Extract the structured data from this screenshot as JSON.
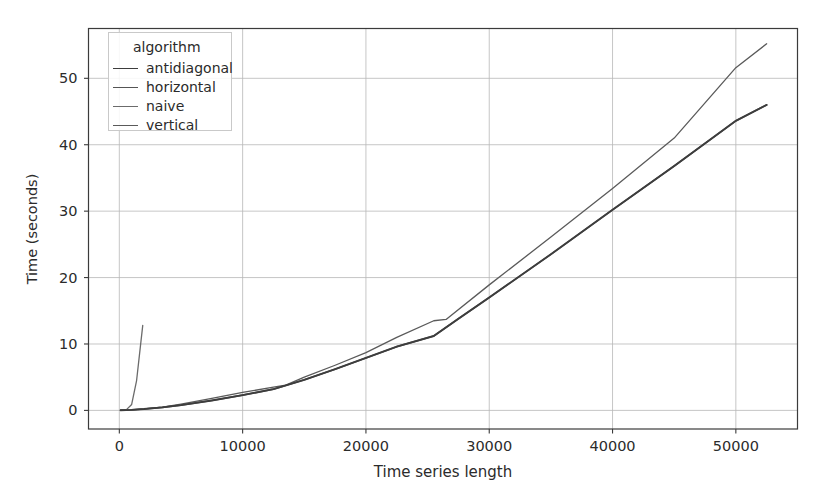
{
  "chart_data": {
    "type": "line",
    "title": "",
    "xlabel": "Time series length",
    "ylabel": "Time (seconds)",
    "xlim": [
      -2500,
      55000
    ],
    "ylim": [
      -2.8,
      57.5
    ],
    "xticks": [
      0,
      10000,
      20000,
      30000,
      40000,
      50000
    ],
    "xticklabels": [
      "0",
      "10000",
      "20000",
      "30000",
      "40000",
      "50000"
    ],
    "yticks": [
      0,
      10,
      20,
      30,
      40,
      50
    ],
    "yticklabels": [
      "0",
      "10",
      "20",
      "30",
      "40",
      "50"
    ],
    "grid": true,
    "legend": {
      "title": "algorithm",
      "position": "upper left",
      "entries": [
        "antidiagonal",
        "horizontal",
        "naive",
        "vertical"
      ]
    },
    "series": [
      {
        "name": "antidiagonal",
        "color": "#3d3d3d",
        "linewidth": 1.9,
        "x": [
          100,
          1000,
          2000,
          3500,
          5000,
          7500,
          10000,
          12500,
          15000,
          17500,
          20000,
          22500,
          25500,
          27500,
          30000,
          35000,
          40000,
          45000,
          50000,
          52500
        ],
        "y": [
          0.02,
          0.08,
          0.2,
          0.45,
          0.8,
          1.5,
          2.3,
          3.2,
          4.6,
          6.2,
          7.9,
          9.6,
          11.2,
          13.8,
          17.0,
          23.5,
          30.2,
          36.8,
          43.6,
          46.0
        ]
      },
      {
        "name": "horizontal",
        "color": "#555555",
        "linewidth": 1.6,
        "x": [
          100,
          1000,
          2000,
          3500,
          5000,
          7500,
          10000,
          12500,
          15000,
          17500,
          20000,
          22500,
          25500,
          27500,
          30000,
          35000,
          40000,
          45000,
          50000,
          52500
        ],
        "y": [
          0.02,
          0.08,
          0.2,
          0.45,
          0.8,
          1.5,
          2.3,
          3.2,
          4.6,
          6.2,
          7.9,
          9.6,
          11.2,
          13.8,
          17.0,
          23.5,
          30.2,
          36.8,
          43.6,
          46.0
        ]
      },
      {
        "name": "naive",
        "color": "#6b6b6b",
        "linewidth": 1.3,
        "x": [
          100,
          600,
          1000,
          1400,
          1700,
          1900
        ],
        "y": [
          0.02,
          0.15,
          0.9,
          4.5,
          9.5,
          12.8
        ]
      },
      {
        "name": "vertical",
        "color": "#5a5a5a",
        "linewidth": 1.3,
        "x": [
          100,
          1000,
          2000,
          3500,
          5000,
          7500,
          10000,
          12500,
          13500,
          15000,
          17500,
          20000,
          22500,
          25500,
          26500,
          30000,
          35000,
          40000,
          45000,
          50000,
          52500
        ],
        "y": [
          0.02,
          0.08,
          0.22,
          0.5,
          0.95,
          1.8,
          2.7,
          3.5,
          3.8,
          5.0,
          6.8,
          8.7,
          11.0,
          13.5,
          13.7,
          18.9,
          26.1,
          33.4,
          41.0,
          51.6,
          55.2
        ]
      }
    ]
  },
  "axes": {
    "xlabel": "Time series length",
    "ylabel": "Time (seconds)"
  }
}
